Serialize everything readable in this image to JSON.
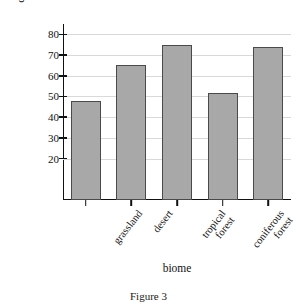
{
  "figure": {
    "caption": "Figure 3"
  },
  "chart_data": {
    "type": "bar",
    "xlabel": "biome",
    "ylabel": "% of ammonium converted to nitrate",
    "categories": [
      "grassland",
      "desert",
      "tropical forest",
      "coniferous forest",
      "deciduous forest"
    ],
    "category_lines": [
      [
        "grassland"
      ],
      [
        "desert"
      ],
      [
        "tropical",
        "forest"
      ],
      [
        "coniferous",
        "forest"
      ],
      [
        "deciduous",
        "forest"
      ]
    ],
    "values": [
      48,
      65,
      75,
      51.5,
      74
    ],
    "ylim": [
      0,
      85
    ],
    "yticks": [
      20,
      30,
      40,
      50,
      60,
      70,
      80
    ],
    "ytick_labels": [
      "20",
      "30",
      "40",
      "50",
      "60",
      "70",
      "80"
    ],
    "grid": true,
    "legend": false,
    "bar_color": "#a8a8a8",
    "bar_edge_color": "#4a4a4a",
    "gridline_color": "#d9d9d9",
    "axis_color": "#111111"
  },
  "ylabel_lines": [
    "% of ammonium",
    "converted to nitrate"
  ]
}
